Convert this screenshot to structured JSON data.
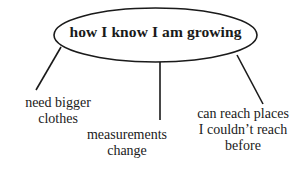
{
  "diagram": {
    "type": "concept-map",
    "center": {
      "label": "how I know I am growing",
      "shape": "ellipse"
    },
    "branches": [
      {
        "lines": [
          "need bigger",
          "clothes"
        ]
      },
      {
        "lines": [
          "measurements",
          "change"
        ]
      },
      {
        "lines": [
          "can reach places",
          "I couldn’t reach",
          "before"
        ]
      }
    ],
    "colors": {
      "stroke": "#1a1a1a",
      "text": "#1a1a1a",
      "background": "#ffffff"
    }
  }
}
